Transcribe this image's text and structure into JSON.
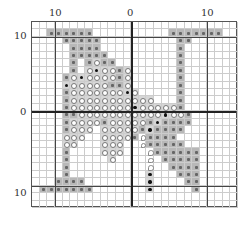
{
  "labels": {
    "top_left": "10",
    "top_center": "0",
    "top_right": "10",
    "left_top": "10",
    "left_center": "0",
    "left_bottom": "10"
  },
  "grid": {
    "cols": 27,
    "rows": 25,
    "center_col": 13,
    "center_row": 12,
    "legend": {
      "x": "gray cross-stitch symbol",
      "o": "circle symbol on light gray",
      "b": "black dot on light gray",
      "h": "hook symbol on white",
      ".": "empty"
    },
    "cells": [
      "...........................",
      "..xxxxxx..........xxxxxxx..",
      "....xxxxx..........xx......",
      ".....xxxx..........x.......",
      ".....xxxxx.........x.......",
      ".....x.xoxx........x.......",
      ".....x.obooxo......x.......",
      "....xobooooxo......x.......",
      "....boooooxxo......x.......",
      "....xooooooobo.....x.......",
      "....xooooooooooo...x.......",
      "....xoooooooobooooox.......",
      "....xxoooooooooooboox......",
      "....xooooxoooooxbxxxx......",
      "....xooo.oooooxbxxxx.......",
      "....ooo..ooooxhxxxx........",
      "....oo...ooo..hxxxxx.......",
      "....x....ooo...hxxxxxx.....",
      "....x.....o....h.xxxxx.....",
      "....x..........h..xxxx.....",
      "....x..........b...xxx.....",
      "...xxxx........b....xx.....",
      ".xxxxxxx.......b.....x.....",
      "...........................",
      "..........................."
    ]
  }
}
